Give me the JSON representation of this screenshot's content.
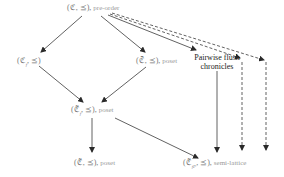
{
  "diagram": {
    "nodes": {
      "preorder": {
        "math": "(ℭ, ⪯),",
        "desc": "pre-order"
      },
      "cf": {
        "math": "(ℭ",
        "sub": "f",
        "math2": ", ⪯)"
      },
      "cbar": {
        "math": "(ℭ̄, ⪯),",
        "desc": "poset"
      },
      "pairwise": {
        "line1": "Pairwise flush",
        "line2": "chronicles"
      },
      "ctilde_f": {
        "math": "(ℭ̃",
        "sub": "f",
        "math2": ", ⪯),",
        "desc": "poset"
      },
      "ctilde": {
        "math": "(ℭ̃, ⪯),",
        "desc": "poset"
      },
      "ctilde_fp": {
        "math": "(ℭ̃",
        "sub": "fP",
        "math2": ", ⪯),",
        "desc": "semi-lattice"
      }
    },
    "edges": [
      {
        "from": "preorder",
        "to": "cf",
        "style": "solid"
      },
      {
        "from": "preorder",
        "to": "cbar",
        "style": "solid"
      },
      {
        "from": "preorder",
        "to": "pairwise",
        "style": "solid"
      },
      {
        "from": "preorder",
        "to": "offscreen-1",
        "style": "dashed"
      },
      {
        "from": "preorder",
        "to": "offscreen-2",
        "style": "dashed"
      },
      {
        "from": "cf",
        "to": "ctilde_f",
        "style": "solid"
      },
      {
        "from": "cbar",
        "to": "ctilde_f",
        "style": "solid"
      },
      {
        "from": "ctilde_f",
        "to": "ctilde",
        "style": "solid"
      },
      {
        "from": "ctilde_f",
        "to": "ctilde_fp",
        "style": "solid"
      },
      {
        "from": "pairwise",
        "to": "ctilde_fp",
        "style": "solid"
      },
      {
        "from": "dashed-1",
        "to": "bottom",
        "style": "dashed"
      },
      {
        "from": "dashed-2",
        "to": "bottom",
        "style": "dashed"
      }
    ],
    "colors": {
      "edge": "#2a2a2a",
      "label": "#8a8a8a",
      "text_dark": "#222222"
    }
  }
}
